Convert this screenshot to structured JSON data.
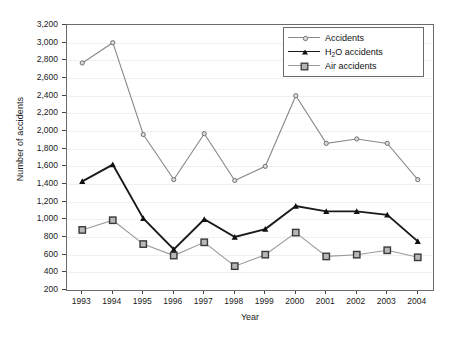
{
  "chart_data": {
    "type": "line",
    "title": "",
    "xlabel": "Year",
    "ylabel": "Number of accidents",
    "categories": [
      "1993",
      "1994",
      "1995",
      "1996",
      "1997",
      "1998",
      "1999",
      "2000",
      "2001",
      "2002",
      "2003",
      "2004"
    ],
    "x": [
      1993,
      1994,
      1995,
      1996,
      1997,
      1998,
      1999,
      2000,
      2001,
      2002,
      2003,
      2004
    ],
    "ylim": [
      200,
      3200
    ],
    "ytick_labels": [
      "200",
      "400",
      "600",
      "800",
      "1,000",
      "1,200",
      "1,400",
      "1,600",
      "1,800",
      "2,000",
      "2,200",
      "2,400",
      "2,600",
      "2,800",
      "3,000",
      "3,200"
    ],
    "ytick_values": [
      200,
      400,
      600,
      800,
      1000,
      1200,
      1400,
      1600,
      1800,
      2000,
      2200,
      2400,
      2600,
      2800,
      3000,
      3200
    ],
    "grid": true,
    "legend_position": "top-right",
    "series": [
      {
        "name": "Accidents",
        "marker": "circle",
        "color": "#8a8a8a",
        "values": [
          2770,
          3000,
          1960,
          1450,
          1970,
          1440,
          1600,
          2400,
          1860,
          1910,
          1860,
          1450
        ]
      },
      {
        "name": "H2O accidents",
        "label_html": "H<sub>2</sub>O accidents",
        "marker": "triangle",
        "color": "#1a1a1a",
        "values": [
          1430,
          1620,
          1010,
          660,
          1000,
          800,
          890,
          1150,
          1090,
          1090,
          1050,
          750
        ]
      },
      {
        "name": "Air accidents",
        "marker": "square",
        "color": "#9a9a9a",
        "values": [
          880,
          990,
          720,
          590,
          740,
          470,
          600,
          850,
          580,
          600,
          650,
          570
        ]
      }
    ]
  },
  "legend": {
    "items": [
      {
        "label": "Accidents"
      },
      {
        "label_prefix": "H",
        "label_sub": "2",
        "label_suffix": "O accidents"
      },
      {
        "label": "Air accidents"
      }
    ]
  }
}
